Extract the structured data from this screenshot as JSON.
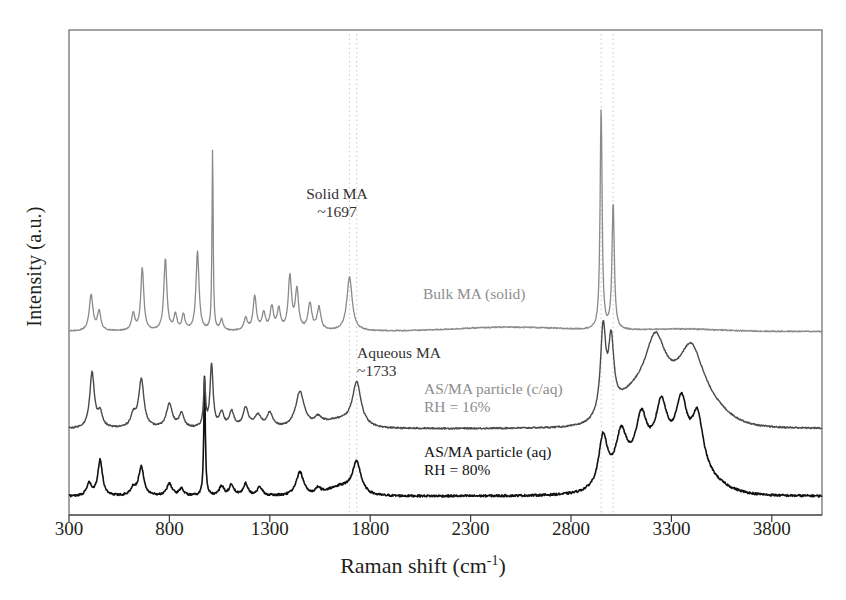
{
  "axes": {
    "xlabel_main": "Raman shift (cm",
    "xlabel_sup": "-1",
    "xlabel_close": ")",
    "ylabel": "Intensity (a.u.)",
    "xticks": [
      300,
      800,
      1300,
      1800,
      2300,
      2800,
      3300,
      3800
    ],
    "xlim": [
      300,
      4050
    ]
  },
  "annotations": {
    "solid_ma_line1": "Solid MA",
    "solid_ma_line2": "~1697",
    "aqueous_ma_line1": "Aqueous MA",
    "aqueous_ma_line2": "~1733",
    "bulk_label": "Bulk MA (solid)",
    "mid_label_line1": "AS/MA particle (c/aq)",
    "mid_label_line2": "RH = 16%",
    "bottom_label_line1": "AS/MA particle (aq)",
    "bottom_label_line2": "RH = 80%"
  },
  "colors": {
    "frame": "#5a5a5a",
    "bulk_trace": "#8a8a8a",
    "mid_trace": "#4a4a4a",
    "bottom_trace": "#111111",
    "guide_line": "#d8b8b8",
    "text": "#231f20",
    "gray_text": "#8d8d8d"
  },
  "chart_data": {
    "type": "line",
    "title": "",
    "xlabel": "Raman shift (cm-1)",
    "ylabel": "Intensity (a.u.)",
    "xlim": [
      300,
      4050
    ],
    "ylim": [
      0,
      3
    ],
    "grid": false,
    "legend": "inline-labels",
    "guide_lines_cm1": [
      1697,
      1733,
      2950,
      3010
    ],
    "annotated_peaks": [
      {
        "label": "Solid MA",
        "position_cm1": 1697,
        "trace": "Bulk MA (solid)"
      },
      {
        "label": "Aqueous MA",
        "position_cm1": 1733,
        "trace": "AS/MA particle (c/aq) RH = 16%"
      }
    ],
    "series": [
      {
        "name": "Bulk MA (solid)",
        "color": "#8a8a8a",
        "offset": 2,
        "peaks_cm1": [
          410,
          450,
          620,
          665,
          780,
          830,
          870,
          940,
          1015,
          1060,
          1180,
          1225,
          1270,
          1310,
          1345,
          1400,
          1435,
          1500,
          1545,
          1697,
          2950,
          3010
        ],
        "peak_intensities": [
          0.3,
          0.16,
          0.14,
          0.52,
          0.6,
          0.13,
          0.13,
          0.66,
          1.5,
          0.09,
          0.1,
          0.28,
          0.14,
          0.19,
          0.17,
          0.44,
          0.33,
          0.22,
          0.19,
          0.45,
          1.85,
          1.05
        ],
        "baseline": 0.03
      },
      {
        "name": "AS/MA particle (c/aq) RH = 16%",
        "color": "#4a4a4a",
        "offset": 1,
        "peaks_cm1": [
          415,
          455,
          620,
          660,
          800,
          860,
          975,
          1010,
          1060,
          1110,
          1180,
          1240,
          1300,
          1450,
          1540,
          1733,
          2960,
          3000,
          3220,
          3400
        ],
        "peak_intensities": [
          0.46,
          0.12,
          0.1,
          0.4,
          0.2,
          0.12,
          0.38,
          0.52,
          0.12,
          0.13,
          0.16,
          0.1,
          0.12,
          0.3,
          0.06,
          0.36,
          0.72,
          0.56,
          0.48,
          0.4
        ],
        "baseline": 0.05
      },
      {
        "name": "AS/MA particle (aq) RH = 80%",
        "color": "#111111",
        "offset": 0,
        "peaks_cm1": [
          400,
          455,
          620,
          660,
          800,
          860,
          975,
          1060,
          1110,
          1180,
          1250,
          1450,
          1540,
          1733,
          2960,
          3050,
          3150,
          3250,
          3350,
          3430
        ],
        "peak_intensities": [
          0.1,
          0.3,
          0.06,
          0.24,
          0.1,
          0.06,
          1.0,
          0.08,
          0.09,
          0.1,
          0.07,
          0.2,
          0.05,
          0.26,
          0.42,
          0.38,
          0.4,
          0.42,
          0.46,
          0.44
        ],
        "baseline": 0.03
      }
    ]
  }
}
